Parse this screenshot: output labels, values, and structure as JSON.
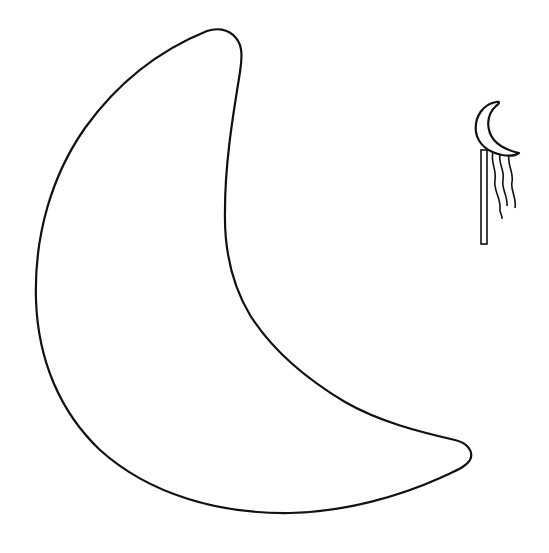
{
  "page": {
    "title": "Crescent moon coloring template",
    "background_color": "#ffffff",
    "line_color": "#111111"
  },
  "figures": [
    {
      "name": "large-crescent-moon",
      "description": "Large outlined crescent moon shape for coloring",
      "fill": "none"
    },
    {
      "name": "moon-on-stick-icon",
      "description": "Small crescent moon mounted on a stick with three wavy streamers",
      "streamer_count": 3
    }
  ]
}
